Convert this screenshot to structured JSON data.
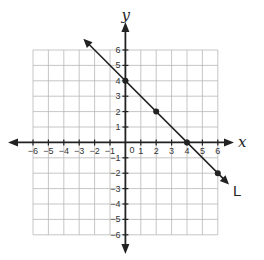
{
  "chart_data": {
    "type": "line",
    "title": "",
    "xlabel": "x",
    "ylabel": "y",
    "xlim": [
      -6,
      6
    ],
    "ylim": [
      -6,
      6
    ],
    "grid": true,
    "x_ticks": [
      -6,
      -5,
      -4,
      -3,
      -2,
      -1,
      0,
      1,
      2,
      3,
      4,
      5,
      6
    ],
    "y_ticks": [
      -6,
      -5,
      -4,
      -3,
      -2,
      -1,
      1,
      2,
      3,
      4,
      5,
      6
    ],
    "origin_label": "0",
    "series": [
      {
        "name": "L",
        "equation": "y = -x + 4",
        "slope": -1,
        "intercept": 4,
        "points": [
          {
            "x": 0,
            "y": 4
          },
          {
            "x": 2,
            "y": 2
          },
          {
            "x": 4,
            "y": 0
          },
          {
            "x": 6,
            "y": -2
          }
        ],
        "extent": [
          {
            "x": -2.6,
            "y": 6.6
          },
          {
            "x": 6.6,
            "y": -2.6
          }
        ],
        "arrows": "both",
        "color": "#222222"
      }
    ]
  },
  "colors": {
    "grid": "#b8b8b8",
    "axis": "#222222",
    "line": "#222222",
    "background": "#ffffff"
  },
  "layout": {
    "grid_left": 33,
    "grid_top": 50,
    "cell": 15.4
  }
}
